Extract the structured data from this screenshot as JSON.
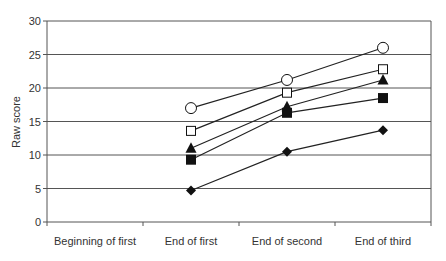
{
  "chart_data": {
    "type": "line",
    "title": "",
    "xlabel": "",
    "ylabel": "Raw score",
    "categories": [
      "Beginning of first",
      "End of first",
      "End of second",
      "End of third"
    ],
    "ylim": [
      0,
      30
    ],
    "yticks": [
      0,
      5,
      10,
      15,
      20,
      25,
      30
    ],
    "grid": true,
    "legend": "none",
    "series": [
      {
        "name": "open-circle",
        "marker": "circle-open",
        "values": [
          null,
          17.0,
          21.2,
          26.0
        ]
      },
      {
        "name": "open-square",
        "marker": "square-open",
        "values": [
          null,
          13.6,
          19.3,
          22.8
        ]
      },
      {
        "name": "filled-triangle",
        "marker": "triangle-filled",
        "values": [
          null,
          11.0,
          17.2,
          21.2
        ]
      },
      {
        "name": "filled-square",
        "marker": "square-filled",
        "values": [
          null,
          9.3,
          16.3,
          18.5
        ]
      },
      {
        "name": "filled-diamond",
        "marker": "diamond-filled",
        "values": [
          null,
          4.7,
          10.5,
          13.7
        ]
      }
    ]
  },
  "colors": {
    "grid": "#555555",
    "line": "#222222",
    "marker": "#111111",
    "text": "#333333"
  }
}
